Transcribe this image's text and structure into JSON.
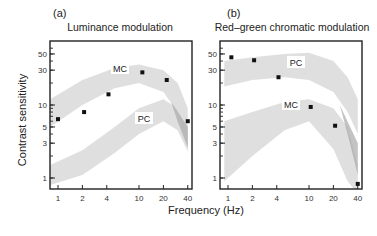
{
  "figure": {
    "xlabel": "Frequency (Hz)",
    "ylabel": "Contrast sensitivity"
  },
  "chart_data": [
    {
      "type": "scatter",
      "panel": "(a)",
      "title": "Luminance modulation",
      "xlabel": "Frequency (Hz)",
      "ylabel": "Contrast sensitivity",
      "xscale": "log",
      "yscale": "log",
      "xticks": [
        1,
        2,
        4,
        10,
        20,
        40
      ],
      "yticks": [
        1,
        3,
        5,
        10,
        30,
        50
      ],
      "xlim": [
        0.8,
        45
      ],
      "ylim": [
        0.75,
        70
      ],
      "grid": false,
      "series": [
        {
          "name": "Measured",
          "x": [
            1,
            2.1,
            4.2,
            11,
            22,
            40
          ],
          "y": [
            6.4,
            8,
            14,
            28,
            22,
            6
          ]
        }
      ],
      "bands": [
        {
          "name": "MC",
          "upper": [
            [
              0.8,
              12
            ],
            [
              2,
              22
            ],
            [
              5,
              32
            ],
            [
              10,
              36
            ],
            [
              20,
              30
            ],
            [
              30,
              20
            ],
            [
              40,
              9
            ]
          ],
          "lower": [
            [
              0.8,
              5
            ],
            [
              2,
              10
            ],
            [
              5,
              17
            ],
            [
              10,
              20
            ],
            [
              20,
              15
            ],
            [
              30,
              8
            ],
            [
              40,
              3
            ]
          ]
        },
        {
          "name": "PC",
          "upper": [
            [
              0.8,
              1.5
            ],
            [
              2,
              2.4
            ],
            [
              5,
              5
            ],
            [
              10,
              9
            ],
            [
              20,
              12
            ],
            [
              30,
              9
            ],
            [
              40,
              4
            ]
          ],
          "lower": [
            [
              0.8,
              0.8
            ],
            [
              2,
              1.1
            ],
            [
              5,
              2.2
            ],
            [
              10,
              4
            ],
            [
              20,
              6
            ],
            [
              30,
              4.5
            ],
            [
              40,
              2.3
            ]
          ]
        }
      ],
      "annotations": [
        "MC",
        "PC"
      ]
    },
    {
      "type": "scatter",
      "panel": "(b)",
      "title": "Red–green chromatic modulation",
      "xlabel": "Frequency (Hz)",
      "ylabel": "Contrast sensitivity",
      "xscale": "log",
      "yscale": "log",
      "xticks": [
        1,
        2,
        4,
        10,
        20,
        40
      ],
      "yticks": [
        1,
        3,
        5,
        10,
        30,
        50
      ],
      "xlim": [
        0.8,
        45
      ],
      "ylim": [
        0.75,
        70
      ],
      "grid": false,
      "series": [
        {
          "name": "Measured",
          "x": [
            1.1,
            2.1,
            4.2,
            10.5,
            21,
            40
          ],
          "y": [
            45,
            41,
            24,
            9.4,
            5.2,
            0.83
          ]
        }
      ],
      "bands": [
        {
          "name": "PC",
          "upper": [
            [
              0.9,
              40
            ],
            [
              2,
              45
            ],
            [
              5,
              50
            ],
            [
              10,
              52
            ],
            [
              20,
              40
            ],
            [
              30,
              24
            ],
            [
              40,
              12
            ]
          ],
          "lower": [
            [
              0.9,
              18
            ],
            [
              2,
              22
            ],
            [
              5,
              24
            ],
            [
              10,
              22
            ],
            [
              20,
              15
            ],
            [
              30,
              8
            ],
            [
              40,
              4
            ]
          ]
        },
        {
          "name": "MC",
          "upper": [
            [
              0.9,
              6
            ],
            [
              2,
              8
            ],
            [
              5,
              11
            ],
            [
              10,
              12
            ],
            [
              20,
              9
            ],
            [
              30,
              5
            ],
            [
              40,
              1.5
            ]
          ],
          "lower": [
            [
              0.9,
              0.9
            ],
            [
              2,
              2
            ],
            [
              5,
              4.5
            ],
            [
              10,
              6
            ],
            [
              20,
              2.5
            ],
            [
              30,
              0.9
            ],
            [
              40,
              0.6
            ]
          ]
        }
      ],
      "annotations": [
        "PC",
        "MC"
      ]
    }
  ],
  "colors": {
    "band": "#d9d9d9",
    "band_overlap": "#a9a9a9",
    "axis": "#222222",
    "marker": "#111111",
    "label_bg": "#ffffff"
  }
}
